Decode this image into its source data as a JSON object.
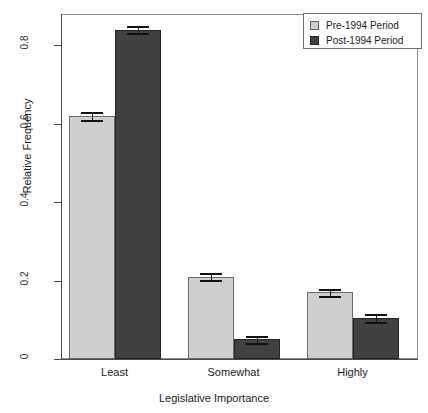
{
  "chart_data": {
    "type": "bar",
    "title": "",
    "subtitle": "",
    "xlabel": "Legislative Importance",
    "ylabel": "Relative Frequency",
    "categories": [
      "Least",
      "Somewhat",
      "Highly"
    ],
    "ylim": [
      0,
      0.88
    ],
    "ytick_values": [
      0,
      0.2,
      0.4,
      0.6,
      0.8
    ],
    "ytick_labels": [
      "0",
      "0.2",
      "0.4",
      "0.6",
      "0.8"
    ],
    "grid": false,
    "legend_position": "top-right",
    "series": [
      {
        "name": "Pre-1994 Period",
        "color": "#cfcfcf",
        "values": [
          0.62,
          0.21,
          0.17
        ],
        "errors": [
          0.011,
          0.009,
          0.009
        ]
      },
      {
        "name": "Post-1994 Period",
        "color": "#414141",
        "values": [
          0.84,
          0.05,
          0.105
        ],
        "errors": [
          0.009,
          0.008,
          0.011
        ]
      }
    ]
  },
  "axes": {
    "y_title": "Relative Frequency",
    "x_title": "Legislative Importance",
    "y_ticks": [
      {
        "label": "0"
      },
      {
        "label": "0.2"
      },
      {
        "label": "0.4"
      },
      {
        "label": "0.6"
      },
      {
        "label": "0.8"
      }
    ],
    "x_categories": [
      {
        "label": "Least"
      },
      {
        "label": "Somewhat"
      },
      {
        "label": "Highly"
      }
    ]
  },
  "legend": {
    "entries": [
      {
        "label": "Pre-1994 Period",
        "swatch": "light-gray-square"
      },
      {
        "label": "Post-1994 Period",
        "swatch": "dark-gray-square"
      }
    ]
  }
}
